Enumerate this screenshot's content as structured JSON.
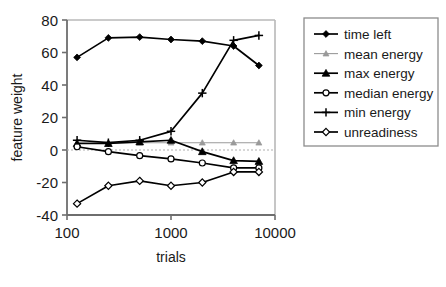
{
  "chart_data": {
    "type": "line",
    "title": "",
    "xlabel": "trials",
    "ylabel": "feature weight",
    "xscale": "log",
    "xlim": [
      100,
      10000
    ],
    "ylim": [
      -40,
      80
    ],
    "xticks": [
      100,
      1000,
      10000
    ],
    "xtick_labels": [
      "100",
      "1000",
      "10000"
    ],
    "yticks": [
      -40,
      -20,
      0,
      20,
      40,
      60,
      80
    ],
    "ytick_labels": [
      "-40",
      "-20",
      "0",
      "20",
      "40",
      "60",
      "80"
    ],
    "grid": false,
    "zero_line": true,
    "legend_position": "right-outside",
    "x": [
      125,
      250,
      500,
      1000,
      2000,
      4000,
      7000
    ],
    "series": [
      {
        "name": "time left",
        "marker": "diamond-filled",
        "color": "#000000",
        "values": [
          57,
          69,
          69.5,
          68,
          67,
          64,
          52
        ]
      },
      {
        "name": "mean energy",
        "marker": "triangle-small",
        "color": "#9a9a9a",
        "values": [
          4.5,
          4.5,
          4.5,
          4.5,
          4.5,
          4.5,
          4.5
        ]
      },
      {
        "name": "max energy",
        "marker": "triangle-filled",
        "color": "#000000",
        "values": [
          4,
          4,
          5,
          6,
          -1,
          -6.5,
          -7
        ]
      },
      {
        "name": "median energy",
        "marker": "circle-open",
        "color": "#000000",
        "values": [
          2,
          -1,
          -3.5,
          -5.5,
          -8,
          -11,
          -11
        ]
      },
      {
        "name": "min energy",
        "marker": "plus",
        "color": "#000000",
        "values": [
          6,
          4.5,
          6,
          11.5,
          35,
          67.5,
          70.5
        ]
      },
      {
        "name": "unreadiness",
        "marker": "diamond-open",
        "color": "#000000",
        "values": [
          -33,
          -22,
          -19,
          -22,
          -20,
          -13.5,
          -13.5
        ]
      }
    ],
    "legend": [
      {
        "label": "time left",
        "marker": "diamond-filled",
        "color": "#000000"
      },
      {
        "label": "mean energy",
        "marker": "triangle-small",
        "color": "#9a9a9a"
      },
      {
        "label": "max energy",
        "marker": "triangle-filled",
        "color": "#000000"
      },
      {
        "label": "median energy",
        "marker": "circle-open",
        "color": "#000000"
      },
      {
        "label": "min energy",
        "marker": "plus",
        "color": "#000000"
      },
      {
        "label": "unreadiness",
        "marker": "diamond-open",
        "color": "#000000"
      }
    ]
  }
}
